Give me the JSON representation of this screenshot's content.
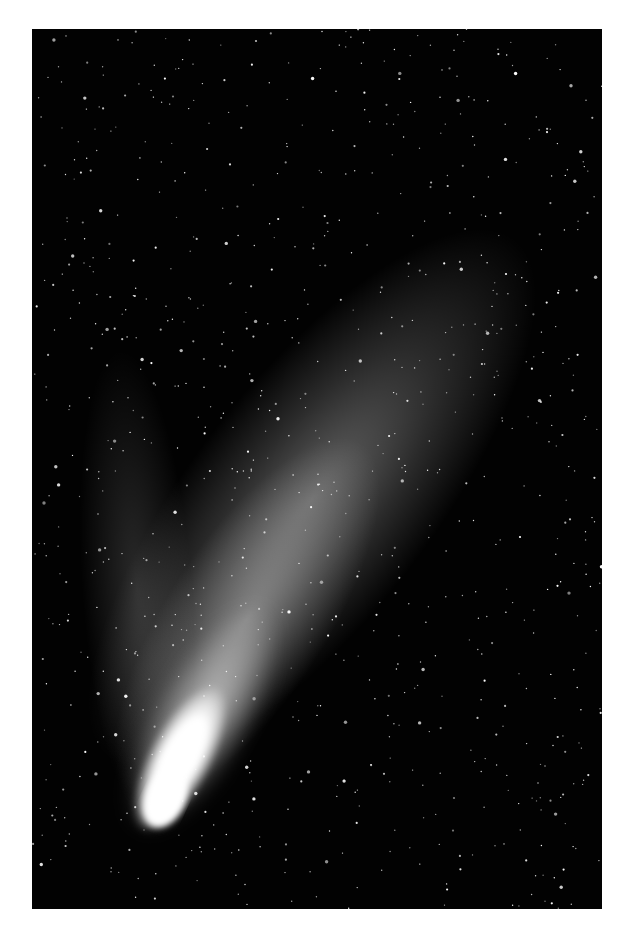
{
  "image": {
    "subject": "comet with dust and ion tails against dense starfield",
    "background_color": "#ffffff",
    "sky_color": "#020202",
    "frame": {
      "left": 32,
      "top": 29,
      "width": 570,
      "height": 880
    },
    "comet": {
      "nucleus": {
        "x": 130,
        "y": 775
      },
      "dust_tail_direction": "upper-right",
      "ion_tail_direction": "up",
      "core_color": "#ffffff"
    },
    "star_count_approx": 900
  }
}
